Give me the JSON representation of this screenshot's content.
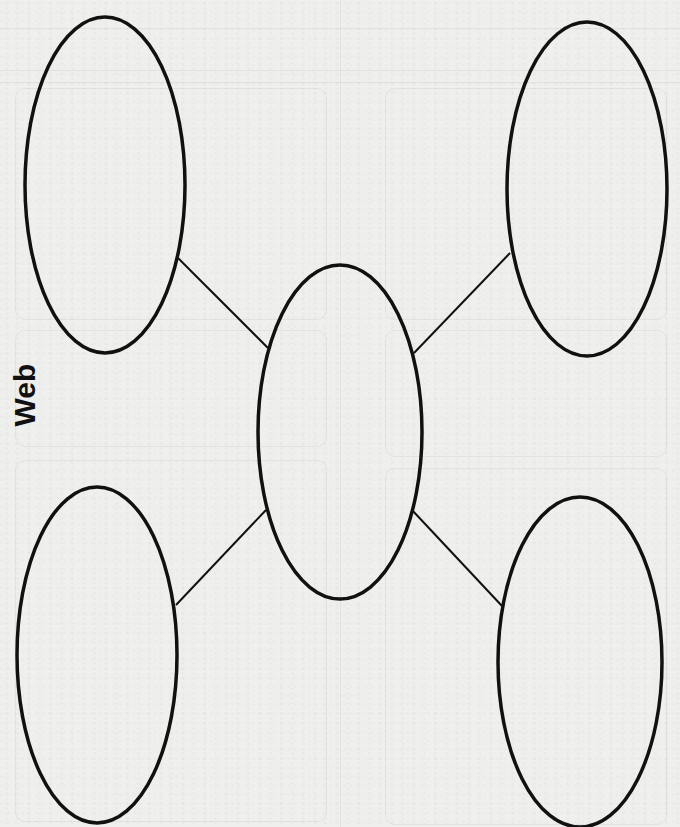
{
  "title": "Web",
  "colors": {
    "background": "#efefed",
    "stroke": "#111111"
  },
  "diagram": {
    "type": "web-graphic-organizer",
    "nodes": [
      {
        "id": "top-left",
        "label": "",
        "cx": 105,
        "cy": 185,
        "rx": 80,
        "ry": 168
      },
      {
        "id": "top-right",
        "label": "",
        "cx": 587,
        "cy": 189,
        "rx": 80,
        "ry": 167
      },
      {
        "id": "center",
        "label": "",
        "cx": 340,
        "cy": 432,
        "rx": 82,
        "ry": 167
      },
      {
        "id": "bottom-left",
        "label": "",
        "cx": 97,
        "cy": 655,
        "rx": 80,
        "ry": 168
      },
      {
        "id": "bottom-right",
        "label": "",
        "cx": 580,
        "cy": 662,
        "rx": 82,
        "ry": 165
      }
    ],
    "edges": [
      {
        "from": "top-left",
        "to": "center"
      },
      {
        "from": "top-right",
        "to": "center"
      },
      {
        "from": "bottom-left",
        "to": "center"
      },
      {
        "from": "bottom-right",
        "to": "center"
      }
    ]
  }
}
